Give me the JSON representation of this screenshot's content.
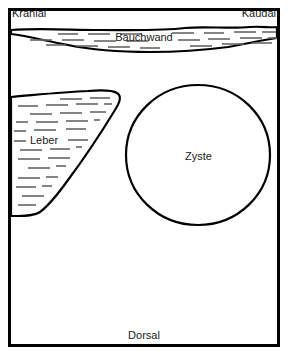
{
  "diagram": {
    "title_top_left": "Kranial",
    "title_top_right": "Kaudal",
    "title_bottom": "Dorsal",
    "labels": {
      "abdominal_wall": "Bauchwand",
      "liver": "Leber",
      "cyst": "Zyste"
    },
    "colors": {
      "outline": "#000000",
      "hatch": "#555555",
      "background": "#ffffff",
      "text": "#1a1a1a"
    },
    "structures": {
      "frame": {
        "x": 8,
        "y": 8,
        "width": 270,
        "height": 337,
        "stroke_width": 3
      },
      "abdominal_wall_band": {
        "top_y": 28,
        "bottom_y_min": 32,
        "bottom_y_max": 50
      },
      "liver_wedge": {
        "left_x": 10,
        "top_y": 92,
        "tip_x": 118,
        "bottom_y": 216
      },
      "cyst_circle": {
        "center_x": 198,
        "center_y": 155,
        "radius_x": 72,
        "radius_y": 70
      }
    }
  }
}
